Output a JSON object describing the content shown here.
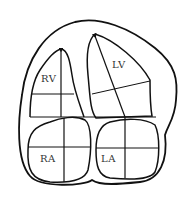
{
  "diagram": {
    "type": "heart-four-chamber-view",
    "colors": {
      "stroke": "#111111",
      "background": "#ffffff",
      "label": "#333333"
    },
    "chambers": [
      {
        "id": "rv",
        "label": "RV"
      },
      {
        "id": "lv",
        "label": "LV"
      },
      {
        "id": "ra",
        "label": "RA"
      },
      {
        "id": "la",
        "label": "LA"
      }
    ]
  }
}
